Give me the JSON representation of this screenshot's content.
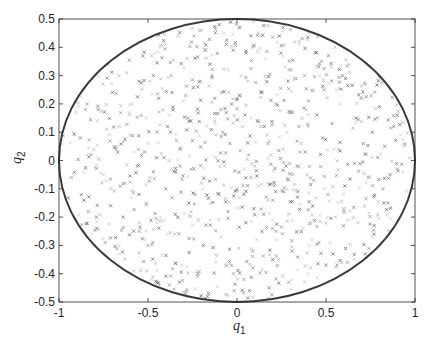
{
  "chart_data": {
    "type": "scatter",
    "title": "",
    "xlabel": "q1",
    "ylabel": "q2",
    "xlim": [
      -1,
      1
    ],
    "ylim": [
      -0.5,
      0.5
    ],
    "grid": false,
    "legend": null,
    "xticks": [
      -1,
      -0.5,
      0,
      0.5,
      1
    ],
    "xtick_labels": [
      "-1",
      "-0.5",
      "0",
      "0.5",
      "1"
    ],
    "yticks": [
      -0.5,
      -0.4,
      -0.3,
      -0.2,
      -0.1,
      0,
      0.1,
      0.2,
      0.3,
      0.4,
      0.5
    ],
    "ytick_labels": [
      "-0.5",
      "-0.4",
      "-0.3",
      "-0.2",
      "-0.1",
      "0",
      "0.1",
      "0.2",
      "0.3",
      "0.4",
      "0.5"
    ],
    "boundary": {
      "shape": "ellipse",
      "center": [
        0,
        0
      ],
      "semi_axis_q1": 1.0,
      "semi_axis_q2": 0.5,
      "color": "#3a3a3a"
    },
    "series": [
      {
        "name": "samples",
        "marker": "x",
        "color": "#6e6e6e",
        "distribution": "uniform inside ellipse (q1/1)^2 + (q2/0.5)^2 <= 1",
        "approx_count": 900,
        "points_sample": [
          [
            -0.62,
            0.31
          ],
          [
            -0.55,
            0.28
          ],
          [
            -0.48,
            0.37
          ],
          [
            -0.4,
            0.41
          ],
          [
            -0.33,
            0.44
          ],
          [
            -0.21,
            0.46
          ],
          [
            -0.1,
            0.48
          ],
          [
            0.02,
            0.47
          ],
          [
            0.12,
            0.45
          ],
          [
            0.24,
            0.44
          ],
          [
            0.35,
            0.42
          ],
          [
            0.44,
            0.38
          ],
          [
            0.53,
            0.33
          ],
          [
            0.61,
            0.29
          ],
          [
            0.7,
            0.22
          ],
          [
            -0.78,
            0.18
          ],
          [
            -0.7,
            0.24
          ],
          [
            -0.66,
            0.12
          ],
          [
            -0.59,
            0.2
          ],
          [
            -0.51,
            0.15
          ],
          [
            -0.44,
            0.22
          ],
          [
            -0.37,
            0.3
          ],
          [
            -0.28,
            0.36
          ],
          [
            -0.18,
            0.39
          ],
          [
            -0.06,
            0.41
          ],
          [
            0.05,
            0.38
          ],
          [
            0.16,
            0.36
          ],
          [
            0.27,
            0.33
          ],
          [
            0.38,
            0.3
          ],
          [
            0.49,
            0.25
          ],
          [
            0.58,
            0.2
          ],
          [
            0.67,
            0.15
          ],
          [
            0.76,
            0.1
          ],
          [
            0.83,
            0.05
          ],
          [
            -0.88,
            0.08
          ],
          [
            -0.82,
            0.02
          ],
          [
            -0.75,
            -0.05
          ],
          [
            -0.68,
            0.04
          ],
          [
            -0.6,
            0.09
          ],
          [
            -0.52,
            0.03
          ],
          [
            -0.45,
            0.1
          ],
          [
            -0.38,
            0.16
          ],
          [
            -0.3,
            0.21
          ],
          [
            -0.22,
            0.26
          ],
          [
            -0.14,
            0.3
          ],
          [
            -0.05,
            0.32
          ],
          [
            0.06,
            0.28
          ],
          [
            0.14,
            0.24
          ],
          [
            0.22,
            0.2
          ],
          [
            0.31,
            0.17
          ],
          [
            0.4,
            0.12
          ],
          [
            0.48,
            0.08
          ],
          [
            0.57,
            0.04
          ],
          [
            0.66,
            -0.01
          ],
          [
            0.74,
            -0.06
          ],
          [
            0.82,
            -0.1
          ],
          [
            0.9,
            -0.03
          ],
          [
            0.94,
            0.05
          ],
          [
            -0.93,
            -0.06
          ],
          [
            -0.86,
            -0.14
          ],
          [
            -0.79,
            -0.2
          ],
          [
            -0.71,
            -0.16
          ],
          [
            -0.63,
            -0.08
          ],
          [
            -0.55,
            -0.12
          ],
          [
            -0.47,
            -0.04
          ],
          [
            -0.4,
            -0.1
          ],
          [
            -0.32,
            -0.02
          ],
          [
            -0.25,
            0.07
          ],
          [
            -0.17,
            0.12
          ],
          [
            -0.09,
            0.18
          ],
          [
            0.0,
            0.22
          ],
          [
            0.08,
            0.15
          ],
          [
            0.17,
            0.09
          ],
          [
            0.26,
            0.04
          ],
          [
            0.34,
            -0.02
          ],
          [
            0.43,
            -0.07
          ],
          [
            0.51,
            -0.12
          ],
          [
            0.6,
            -0.17
          ],
          [
            0.68,
            -0.22
          ],
          [
            0.77,
            -0.26
          ],
          [
            -0.74,
            -0.29
          ],
          [
            -0.66,
            -0.33
          ],
          [
            -0.58,
            -0.25
          ],
          [
            -0.5,
            -0.3
          ],
          [
            -0.43,
            -0.2
          ],
          [
            -0.35,
            -0.26
          ],
          [
            -0.27,
            -0.15
          ],
          [
            -0.2,
            -0.08
          ],
          [
            -0.12,
            0.01
          ],
          [
            -0.04,
            0.06
          ],
          [
            0.04,
            -0.03
          ],
          [
            0.12,
            -0.09
          ],
          [
            0.2,
            -0.14
          ],
          [
            0.29,
            -0.19
          ],
          [
            0.37,
            -0.24
          ],
          [
            0.46,
            -0.29
          ],
          [
            0.54,
            -0.33
          ],
          [
            0.62,
            -0.36
          ],
          [
            -0.58,
            -0.39
          ],
          [
            -0.48,
            -0.42
          ],
          [
            -0.38,
            -0.44
          ],
          [
            -0.28,
            -0.46
          ],
          [
            -0.16,
            -0.47
          ],
          [
            -0.05,
            -0.48
          ],
          [
            0.07,
            -0.46
          ],
          [
            0.18,
            -0.45
          ],
          [
            0.29,
            -0.43
          ],
          [
            0.4,
            -0.4
          ],
          [
            0.5,
            -0.37
          ],
          [
            -0.31,
            -0.37
          ],
          [
            -0.22,
            -0.4
          ],
          [
            -0.12,
            -0.36
          ],
          [
            -0.02,
            -0.4
          ],
          [
            0.09,
            -0.38
          ],
          [
            0.2,
            -0.35
          ],
          [
            0.31,
            -0.32
          ],
          [
            -0.19,
            -0.3
          ],
          [
            -0.09,
            -0.27
          ],
          [
            0.01,
            -0.31
          ],
          [
            0.11,
            -0.28
          ],
          [
            0.22,
            -0.25
          ],
          [
            -0.15,
            -0.21
          ],
          [
            -0.05,
            -0.18
          ],
          [
            0.05,
            -0.22
          ],
          [
            0.15,
            -0.19
          ],
          [
            -0.1,
            -0.12
          ],
          [
            0.0,
            -0.1
          ],
          [
            0.1,
            -0.02
          ],
          [
            0.19,
            0.02
          ],
          [
            -0.08,
            0.1
          ],
          [
            0.03,
            0.12
          ],
          [
            0.28,
            0.1
          ],
          [
            0.36,
            0.06
          ],
          [
            -0.26,
            0.14
          ],
          [
            -0.34,
            0.07
          ],
          [
            -0.41,
            0.01
          ],
          [
            -0.49,
            -0.06
          ],
          [
            -0.56,
            -0.02
          ],
          [
            -0.64,
            -0.2
          ],
          [
            -0.71,
            -0.1
          ],
          [
            0.71,
            0.06
          ],
          [
            0.79,
            0.01
          ],
          [
            0.86,
            -0.05
          ],
          [
            0.88,
            0.12
          ],
          [
            0.8,
            0.19
          ],
          [
            0.72,
            0.27
          ],
          [
            0.63,
            0.34
          ],
          [
            0.55,
            0.4
          ],
          [
            -0.85,
            0.18
          ],
          [
            -0.92,
            0.1
          ]
        ]
      }
    ]
  }
}
